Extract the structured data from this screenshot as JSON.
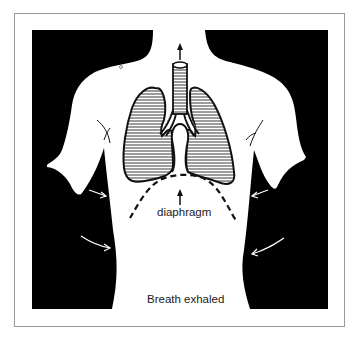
{
  "figure": {
    "title": "Breath exhaled",
    "labels": {
      "diaphragm": "diaphragm",
      "caption": "Breath exhaled"
    },
    "elements": [
      {
        "name": "torso-silhouette",
        "description": "white human torso on black background"
      },
      {
        "name": "trachea",
        "description": "windpipe with horizontal hatching"
      },
      {
        "name": "left-lung",
        "description": "hatched lung"
      },
      {
        "name": "right-lung",
        "description": "hatched lung"
      },
      {
        "name": "diaphragm-line",
        "description": "dashed curved line below lungs, raised"
      },
      {
        "name": "air-out-arrow",
        "description": "arrow pointing up above trachea"
      },
      {
        "name": "diaphragm-arrow",
        "description": "arrow pointing up to diaphragm"
      },
      {
        "name": "rib-arrows",
        "description": "white arrows pointing inward on both sides"
      }
    ],
    "colors": {
      "background": "#000000",
      "body": "#ffffff",
      "lines": "#111111",
      "frame": "#9a9a9a"
    }
  }
}
